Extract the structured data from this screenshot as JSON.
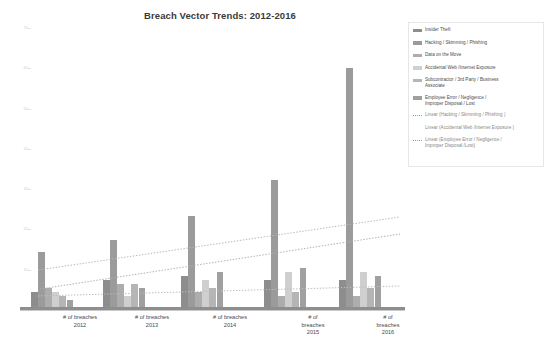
{
  "chart_data": {
    "type": "bar",
    "title": "Breach Vector Trends: 2012-2016",
    "xlabel": "",
    "ylabel": "",
    "grid": false,
    "legend_position": "right",
    "ylim": [
      0,
      70
    ],
    "yticks": [
      "70",
      "60",
      "50",
      "40",
      "30",
      "20",
      "10",
      "0"
    ],
    "categories": [
      "# of breaches\n2012",
      "# of breaches\n2013",
      "# of breaches\n2014",
      "# of\nbreaches\n2015",
      "# of\nbreaches\n2016"
    ],
    "series": [
      {
        "name": "Insider Theft",
        "color": "#8d8d8d",
        "values": [
          4,
          7,
          8,
          7,
          7
        ]
      },
      {
        "name": "Hacking / Skimming / Phishing",
        "color": "#9b9b9b",
        "values": [
          14,
          17,
          23,
          32,
          60
        ]
      },
      {
        "name": "Data on the Move",
        "color": "#adadad",
        "values": [
          5,
          6,
          4,
          3,
          3
        ]
      },
      {
        "name": "Accidental Web /Internet Exposure",
        "color": "#cfcfcf",
        "values": [
          4,
          3,
          7,
          9,
          9
        ]
      },
      {
        "name": "Subcontractor / 3rd Party / Business Associate",
        "color": "#b5b5b5",
        "values": [
          3,
          6,
          5,
          4,
          5
        ]
      },
      {
        "name": "Employee Error / Negligence / Improper Disposal / Lost",
        "color": "#a0a0a0",
        "values": [
          2,
          5,
          9,
          10,
          8
        ]
      }
    ],
    "trendlines": [
      {
        "name": "Linear (Hacking / Skimming / Phishing )",
        "style": "dotted",
        "color": "#b0b0b0",
        "x1": 40,
        "y1": 289,
        "x2": 400,
        "y2": 234
      },
      {
        "name": "Linear (Accidental Web /Internet Exposure )",
        "style": "dotted",
        "color": "#b8b8b8",
        "x1": 38,
        "y1": 270,
        "x2": 400,
        "y2": 217
      },
      {
        "name": "Linear (Employee Error / Negligence / Improper Disposal /Lost)",
        "style": "dotted",
        "color": "#bdbdbd",
        "x1": 38,
        "y1": 296,
        "x2": 400,
        "y2": 286
      }
    ]
  },
  "legend": {
    "items": [
      {
        "label": "Insider Theft",
        "type": "bar",
        "color": "#8d8d8d"
      },
      {
        "label": "Hacking / Skimming / Phishing",
        "type": "bar",
        "color": "#9b9b9b"
      },
      {
        "label": "Data on the Move",
        "type": "bar",
        "color": "#adadad"
      },
      {
        "label": "Accidental Web /Internet Exposure",
        "type": "bar",
        "color": "#cfcfcf"
      },
      {
        "label": "Subcontractor / 3rd Party / Business\n   Associate",
        "type": "bar",
        "color": "#b5b5b5"
      },
      {
        "label": "Employee Error / Negligence /\n   Improper Disposal / Lost",
        "type": "bar",
        "color": "#a0a0a0"
      },
      {
        "label": "Linear (Hacking / Skimming / Phishing )",
        "type": "line",
        "color": "#9a9a9a"
      },
      {
        "label": "Linear (Accidental Web /Internet Exposure )",
        "type": "blank",
        "color": "#ffffff"
      },
      {
        "label": "Linear (Employee Error / Negligence /\n   Improper Disposal /Lost)",
        "type": "line",
        "color": "#9a9a9a"
      }
    ]
  }
}
